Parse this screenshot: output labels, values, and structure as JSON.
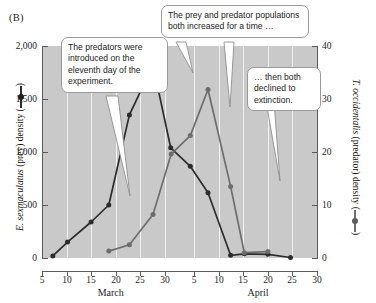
{
  "figure": {
    "panel_label": "(B)",
    "background_plot_color": "#c9c9c9",
    "gridline_color": "#f2f2f2",
    "prey_series_color": "#2c2c2c",
    "predator_series_color": "#6d6d6d"
  },
  "axes": {
    "left": {
      "title_species": "E. sexmaculatus",
      "title_rest": "(prey) density (",
      "title_close": ")",
      "ticks": [
        "0",
        "500",
        "1,000",
        "1,500",
        "2,000"
      ],
      "values": [
        0,
        500,
        1000,
        1500,
        2000
      ],
      "min": 0,
      "max": 2000
    },
    "right": {
      "title_species": "T. occidentalis",
      "title_rest": "(predator) density (",
      "title_close": ")",
      "ticks": [
        "0",
        "10",
        "20",
        "30",
        "40"
      ],
      "values": [
        0,
        10,
        20,
        30,
        40
      ],
      "min": 0,
      "max": 40
    },
    "bottom": {
      "ticks": [
        "5",
        "10",
        "15",
        "20",
        "25",
        "30",
        "5",
        "10",
        "15",
        "20",
        "25",
        "30"
      ],
      "day_values": [
        5,
        10,
        15,
        20,
        25,
        30,
        36,
        41,
        46,
        51,
        56,
        61
      ],
      "month_labels": [
        "March",
        "April"
      ],
      "month_day_positions": [
        19,
        49
      ],
      "min": 5,
      "max": 61
    }
  },
  "callouts": [
    {
      "id": "callout-0",
      "text": "The predators were introduced on the eleventh day of the experiment."
    },
    {
      "id": "callout-1",
      "text": "The prey and predator populations both increased for a time …"
    },
    {
      "id": "callout-2",
      "text": "… then both declined to extinction."
    }
  ],
  "chart_data": {
    "type": "line",
    "title": "",
    "subtitle": "",
    "panel_label": "(B)",
    "xlabel": "",
    "ylabel": "E. sexmaculatus (prey) density",
    "y2label": "T. occidentalis (predator) density",
    "xlim": [
      5,
      61
    ],
    "ylim": [
      0,
      2000
    ],
    "y2lim": [
      0,
      40
    ],
    "grid": "vertical-only",
    "legend_position": "inline-axis-titles",
    "x_tick_labels": [
      "5",
      "10",
      "15",
      "20",
      "25",
      "30",
      "5",
      "10",
      "15",
      "20",
      "25",
      "30"
    ],
    "x_tick_days": [
      5,
      10,
      15,
      20,
      25,
      30,
      36,
      41,
      46,
      51,
      56,
      61
    ],
    "month_bands": [
      {
        "name": "March",
        "center_day": 19
      },
      {
        "name": "April",
        "center_day": 49
      }
    ],
    "series": [
      {
        "name": "E. sexmaculatus (prey) density",
        "axis": "left",
        "color": "#2c2c2c",
        "marker": "circle",
        "x": [
          7.2,
          10.2,
          15.0,
          18.6,
          22.8,
          27.6,
          31.2,
          35.2,
          38.8,
          43.4,
          46.2,
          51.0,
          55.6
        ],
        "values": [
          20,
          150,
          340,
          500,
          1350,
          1820,
          1040,
          865,
          615,
          25,
          40,
          35,
          5
        ],
        "annotations": [
          "Prey rises steeply to a peak of ~1,820 on about 27 March, then collapses to near zero by mid-April."
        ]
      },
      {
        "name": "T. occidentalis (predator) density",
        "axis": "right",
        "color": "#6d6d6d",
        "marker": "circle",
        "x": [
          18.6,
          22.8,
          27.6,
          31.3,
          35.2,
          38.8,
          43.4,
          46.2,
          51.0
        ],
        "values": [
          1.3,
          2.5,
          8.2,
          19.6,
          23.1,
          31.8,
          13.5,
          1.0,
          1.2
        ],
        "annotations": [
          "Predators introduced on 18 March (eleventh day of the experiment); peak of ~32 on about 8 April, then extinction."
        ]
      }
    ]
  }
}
